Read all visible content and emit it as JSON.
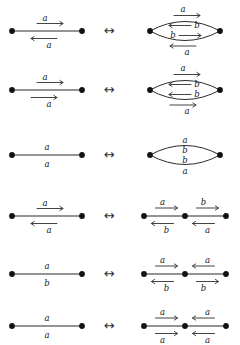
{
  "figure": {
    "background": "#ffffff",
    "ink": "#1a1a1a",
    "equiv_symbol": "↔",
    "width": 240,
    "height": 345,
    "rows": [
      {
        "id": "row-1",
        "equiv": "↔",
        "left": {
          "shape": "segment",
          "vertices": 2,
          "labels": [
            {
              "text": "a",
              "position": "above",
              "arrow": "right"
            },
            {
              "text": "a",
              "position": "below",
              "arrow": "left"
            }
          ]
        },
        "right": {
          "shape": "lens",
          "vertices": 2,
          "labels": [
            {
              "text": "a",
              "position": "outer-top",
              "arrow": "right"
            },
            {
              "text": "b",
              "position": "inner-top",
              "arrow": "left"
            },
            {
              "text": "b",
              "position": "inner-bottom",
              "arrow": "right"
            },
            {
              "text": "a",
              "position": "outer-bottom",
              "arrow": "left"
            }
          ]
        }
      },
      {
        "id": "row-2",
        "equiv": "↔",
        "left": {
          "shape": "segment",
          "vertices": 2,
          "labels": [
            {
              "text": "a",
              "position": "above",
              "arrow": "right"
            },
            {
              "text": "a",
              "position": "below",
              "arrow": "right"
            }
          ]
        },
        "right": {
          "shape": "lens",
          "vertices": 2,
          "labels": [
            {
              "text": "a",
              "position": "outer-top",
              "arrow": "right"
            },
            {
              "text": "b",
              "position": "inner-top",
              "arrow": "left"
            },
            {
              "text": "b",
              "position": "inner-bottom",
              "arrow": "left"
            },
            {
              "text": "a",
              "position": "outer-bottom",
              "arrow": "right"
            }
          ]
        }
      },
      {
        "id": "row-3",
        "equiv": "↔",
        "left": {
          "shape": "segment",
          "vertices": 2,
          "labels": [
            {
              "text": "a",
              "position": "above",
              "arrow": "none"
            },
            {
              "text": "a",
              "position": "below",
              "arrow": "none"
            }
          ]
        },
        "right": {
          "shape": "lens",
          "vertices": 2,
          "labels": [
            {
              "text": "a",
              "position": "outer-top",
              "arrow": "none"
            },
            {
              "text": "b",
              "position": "inner-top",
              "arrow": "none"
            },
            {
              "text": "b",
              "position": "inner-bottom",
              "arrow": "none"
            },
            {
              "text": "a",
              "position": "outer-bottom",
              "arrow": "none"
            }
          ]
        }
      },
      {
        "id": "row-4",
        "equiv": "↔",
        "left": {
          "shape": "segment",
          "vertices": 2,
          "labels": [
            {
              "text": "a",
              "position": "above",
              "arrow": "right"
            },
            {
              "text": "a",
              "position": "below",
              "arrow": "left"
            }
          ]
        },
        "right": {
          "shape": "path",
          "vertices": 3,
          "labels": [
            {
              "text": "a",
              "position": "seg1-above",
              "arrow": "right"
            },
            {
              "text": "b",
              "position": "seg1-below",
              "arrow": "left"
            },
            {
              "text": "b",
              "position": "seg2-above",
              "arrow": "right"
            },
            {
              "text": "a",
              "position": "seg2-below",
              "arrow": "left"
            }
          ]
        }
      },
      {
        "id": "row-5",
        "equiv": "↔",
        "left": {
          "shape": "segment",
          "vertices": 2,
          "labels": [
            {
              "text": "a",
              "position": "above",
              "arrow": "none"
            },
            {
              "text": "b",
              "position": "below",
              "arrow": "none"
            }
          ]
        },
        "right": {
          "shape": "path",
          "vertices": 3,
          "labels": [
            {
              "text": "a",
              "position": "seg1-above",
              "arrow": "right"
            },
            {
              "text": "b",
              "position": "seg1-below",
              "arrow": "left"
            },
            {
              "text": "a",
              "position": "seg2-above",
              "arrow": "left"
            },
            {
              "text": "b",
              "position": "seg2-below",
              "arrow": "right"
            }
          ]
        }
      },
      {
        "id": "row-6",
        "equiv": "↔",
        "left": {
          "shape": "segment",
          "vertices": 2,
          "labels": [
            {
              "text": "a",
              "position": "above",
              "arrow": "none"
            },
            {
              "text": "a",
              "position": "below",
              "arrow": "none"
            }
          ]
        },
        "right": {
          "shape": "path",
          "vertices": 3,
          "labels": [
            {
              "text": "a",
              "position": "seg1-above",
              "arrow": "right"
            },
            {
              "text": "a",
              "position": "seg1-below",
              "arrow": "right"
            },
            {
              "text": "a",
              "position": "seg2-above",
              "arrow": "left"
            },
            {
              "text": "a",
              "position": "seg2-below",
              "arrow": "left"
            }
          ]
        }
      }
    ]
  }
}
